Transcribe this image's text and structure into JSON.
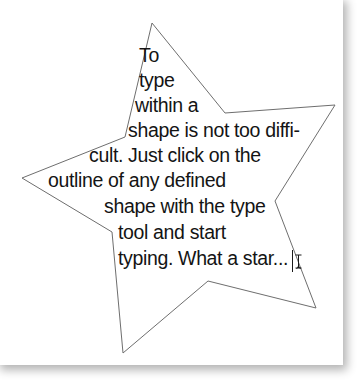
{
  "document": {
    "background_color": "#ffffff",
    "canvas_color": "#ffffff",
    "shadow_color": "rgba(0,0,0,0.30)"
  },
  "shape": {
    "name": "star",
    "stroke_color": "#6e6e6e",
    "fill": "none",
    "stroke_width": 1,
    "points": "152,23 225,113 335,105 275,201 316,308 208,281 123,353 112,232 22,178 125,137"
  },
  "text_frame": {
    "font_size_px": 19.5,
    "line_height_px": 25,
    "color": "#141414",
    "lines": [
      {
        "text": "To",
        "x": 139,
        "y": 45
      },
      {
        "text": "type",
        "x": 139,
        "y": 70
      },
      {
        "text": "within a",
        "x": 135,
        "y": 95
      },
      {
        "text": "shape is not too diffi-",
        "x": 128,
        "y": 120
      },
      {
        "text": "cult. Just click on the",
        "x": 89,
        "y": 145
      },
      {
        "text": "outline of any defined",
        "x": 48,
        "y": 170
      },
      {
        "text": "shape with the type",
        "x": 104,
        "y": 196
      },
      {
        "text": "tool and start",
        "x": 118,
        "y": 222
      },
      {
        "text": "typing. What a star...",
        "x": 118,
        "y": 248
      }
    ],
    "full_text": "To type within a shape is not too difficult. Just click on the outline of any defined shape with the type tool and start typing. What a star..."
  },
  "cursor": {
    "name": "text-ibeam-cursor",
    "x": 292,
    "y": 250,
    "caret_height": 22,
    "color": "#1a1a1a"
  }
}
